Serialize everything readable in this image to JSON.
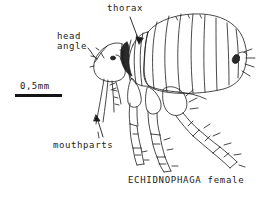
{
  "figure": {
    "background_color": "#ffffff",
    "ink_color": "#1a1a1a",
    "width": 268,
    "height": 198
  },
  "scale": {
    "label": "0,5mm",
    "bar_length_px": 47
  },
  "labels": {
    "thorax": "thorax",
    "head_angle_line1": "head",
    "head_angle_line2": "angle",
    "mouthparts": "mouthparts"
  },
  "caption": {
    "text": "ECHIDNOPHAGA female",
    "genus": "ECHIDNOPHAGA",
    "sex": "female"
  },
  "anatomy": {
    "parts": [
      "head",
      "head angle",
      "mouthparts",
      "thorax",
      "abdomen",
      "legs",
      "spiracle"
    ],
    "abdominal_segments": 8
  }
}
